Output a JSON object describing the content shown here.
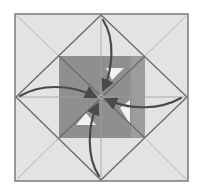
{
  "diagram": {
    "type": "origami-fold-diagram",
    "width": 200,
    "height": 192,
    "colors": {
      "background": "#ffffff",
      "paper": "#e3e3e3",
      "outer_border": "#7a7a7a",
      "crease": "#9a9a9a",
      "diamond_edge": "#6e6e6e",
      "inner_flap": "#8f8f8f",
      "inner_flap_right": "#9c9c9c",
      "window": "#f2f2f2",
      "arrow": "#4a4a4a"
    },
    "outer_square": {
      "x1": 15,
      "y1": 14,
      "x2": 188,
      "y2": 181
    },
    "center": {
      "x": 101,
      "y": 97
    },
    "diamond": [
      [
        101,
        15
      ],
      [
        187,
        97
      ],
      [
        101,
        180
      ],
      [
        16,
        97
      ]
    ],
    "inner_square": {
      "x1": 59,
      "y1": 56,
      "x2": 145,
      "y2": 138
    },
    "windows": [
      [
        [
          106,
          68
        ],
        [
          124,
          68
        ],
        [
          112,
          80
        ]
      ],
      [
        [
          120,
          108
        ],
        [
          130,
          100
        ],
        [
          130,
          124
        ]
      ],
      [
        [
          76,
          125
        ],
        [
          86,
          113
        ],
        [
          96,
          125
        ]
      ]
    ],
    "arrows": [
      {
        "name": "arrow-top",
        "path": "M103 20 C 116 40, 112 70, 104 88"
      },
      {
        "name": "arrow-left",
        "path": "M20 96 C 40 84, 70 84, 94 96"
      },
      {
        "name": "arrow-right",
        "path": "M181 98 C 160 110, 130 110, 108 100"
      },
      {
        "name": "arrow-bottom",
        "path": "M99 176 C 86 156, 88 125, 97 106"
      }
    ]
  }
}
